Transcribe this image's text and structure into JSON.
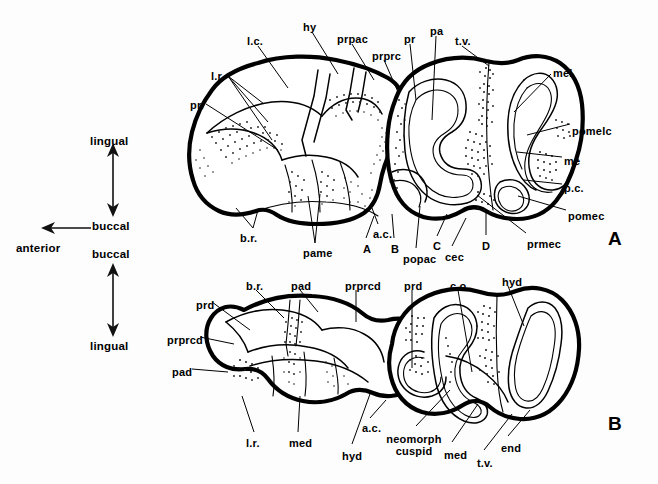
{
  "figure": {
    "caption_none": "",
    "background_color": "#fdfdfd",
    "ink_color": "#000000",
    "panels": [
      {
        "id": "A",
        "label": "A"
      },
      {
        "id": "B",
        "label": "B"
      }
    ]
  },
  "orientation_key": {
    "upper": {
      "top_label": "lingual",
      "bottom_label": "buccal",
      "side_label": "anterior"
    },
    "lower": {
      "top_label": "buccal",
      "bottom_label": "lingual"
    }
  },
  "panel_a": {
    "panel_label": "A",
    "labels": [
      {
        "name": "l-c",
        "text": "l.c.",
        "x": 247,
        "y": 36
      },
      {
        "name": "hy",
        "text": "hy",
        "x": 303,
        "y": 22
      },
      {
        "name": "prpac",
        "text": "prpac",
        "x": 337,
        "y": 34
      },
      {
        "name": "prprc",
        "text": "prprc",
        "x": 372,
        "y": 51
      },
      {
        "name": "pr-upper",
        "text": "pr",
        "x": 404,
        "y": 34
      },
      {
        "name": "pa",
        "text": "pa",
        "x": 430,
        "y": 26
      },
      {
        "name": "t-v",
        "text": "t.v.",
        "x": 455,
        "y": 36
      },
      {
        "name": "mel",
        "text": "mel",
        "x": 553,
        "y": 68
      },
      {
        "name": "pomelc",
        "text": "pomelc",
        "x": 572,
        "y": 126
      },
      {
        "name": "me",
        "text": "me",
        "x": 564,
        "y": 156
      },
      {
        "name": "p-c",
        "text": "p.c.",
        "x": 564,
        "y": 183
      },
      {
        "name": "pomec",
        "text": "pomec",
        "x": 568,
        "y": 211
      },
      {
        "name": "prmec",
        "text": "prmec",
        "x": 527,
        "y": 239
      },
      {
        "name": "l-r",
        "text": "l.r.",
        "x": 211,
        "y": 71
      },
      {
        "name": "pr-left",
        "text": "pr.",
        "x": 190,
        "y": 100
      },
      {
        "name": "b-r",
        "text": "b.r.",
        "x": 240,
        "y": 233
      },
      {
        "name": "pame",
        "text": "pame",
        "x": 303,
        "y": 248
      },
      {
        "name": "a-c",
        "text": "a.c.",
        "x": 373,
        "y": 229
      },
      {
        "name": "marker-A",
        "text": "A",
        "x": 363,
        "y": 244
      },
      {
        "name": "marker-B",
        "text": "B",
        "x": 391,
        "y": 244
      },
      {
        "name": "marker-C",
        "text": "C",
        "x": 433,
        "y": 241
      },
      {
        "name": "cec",
        "text": "cec",
        "x": 445,
        "y": 252
      },
      {
        "name": "popac",
        "text": "popac",
        "x": 403,
        "y": 254
      },
      {
        "name": "marker-D",
        "text": "D",
        "x": 482,
        "y": 241
      }
    ]
  },
  "panel_b": {
    "panel_label": "B",
    "labels": [
      {
        "name": "b-r",
        "text": "b.r.",
        "x": 246,
        "y": 281
      },
      {
        "name": "pad-top",
        "text": "pad",
        "x": 291,
        "y": 281
      },
      {
        "name": "prprcd-top",
        "text": "prprcd",
        "x": 345,
        "y": 281
      },
      {
        "name": "prd-top",
        "text": "prd",
        "x": 404,
        "y": 281
      },
      {
        "name": "c-o",
        "text": "c.o.",
        "x": 450,
        "y": 281
      },
      {
        "name": "hyd-top",
        "text": "hyd",
        "x": 502,
        "y": 277
      },
      {
        "name": "prd-left",
        "text": "prd",
        "x": 196,
        "y": 300
      },
      {
        "name": "prprcd-left",
        "text": "prprcd",
        "x": 167,
        "y": 335
      },
      {
        "name": "pad-left",
        "text": "pad",
        "x": 172,
        "y": 367
      },
      {
        "name": "l-r",
        "text": "l.r.",
        "x": 246,
        "y": 438
      },
      {
        "name": "med-left",
        "text": "med",
        "x": 289,
        "y": 438
      },
      {
        "name": "hyd-bottom",
        "text": "hyd",
        "x": 342,
        "y": 451
      },
      {
        "name": "a-c",
        "text": "a.c.",
        "x": 362,
        "y": 423
      },
      {
        "name": "neomorph-cuspid",
        "text": "neomorph cuspid",
        "x": 385,
        "y": 436
      },
      {
        "name": "med-right",
        "text": "med",
        "x": 444,
        "y": 450
      },
      {
        "name": "t-v",
        "text": "t.v.",
        "x": 477,
        "y": 458
      },
      {
        "name": "end",
        "text": "end",
        "x": 501,
        "y": 443
      }
    ]
  },
  "abbreviation_glossary": {
    "l.c.": "lingual cingulum",
    "hy": "hypocone",
    "prpac": "preparacrista",
    "prprc": "preprotocrista",
    "pr": "protocone",
    "pa": "paracone",
    "t.v.": "transverse valley",
    "mel": "metaloph",
    "pomelc": "postmetalophcrista",
    "me": "metacone",
    "p.c.": "posterior cingulum",
    "pomec": "postmetacrista",
    "prmec": "premetacrista",
    "l.r.": "lingual ridge",
    "b.r.": "buccal ridge",
    "pame": "paramesostyle",
    "a.c.": "anterior cingulum",
    "cec": "centrocrista",
    "popac": "postparacrista",
    "prd": "protoconid",
    "pad": "paraconid",
    "prprcd": "preprotocristid",
    "hyd": "hypoconid",
    "med": "metaconid",
    "end": "entoconid",
    "c.o.": "cristid obliqua"
  }
}
